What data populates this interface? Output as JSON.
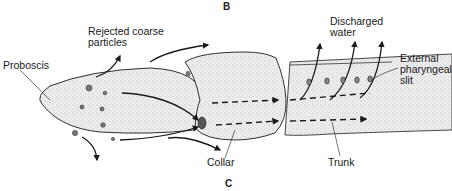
{
  "panels": {
    "top": "B",
    "bottom": "C"
  },
  "labels": {
    "rejected_line1": "Rejected coarse",
    "rejected_line2": "particles",
    "proboscis": "Proboscis",
    "discharged_line1": "Discharged",
    "discharged_line2": "water",
    "slit_line1": "External",
    "slit_line2": "pharyngeal",
    "slit_line3": "slit",
    "collar": "Collar",
    "trunk": "Trunk"
  },
  "colors": {
    "ink": "#1a1a1a",
    "body_fill": "#e6e6e6",
    "background": "#ffffff"
  }
}
